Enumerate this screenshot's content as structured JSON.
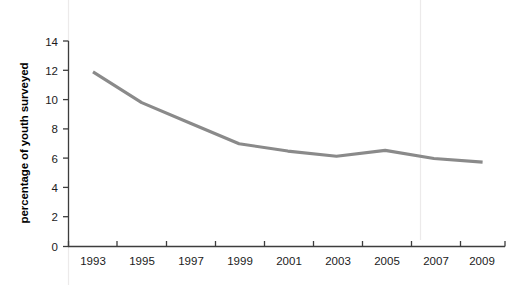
{
  "chart_data": {
    "type": "line",
    "title": "",
    "subtitle": "",
    "xlabel": "",
    "ylabel": "percentage of youth surveyed",
    "categories": [
      "1993",
      "1995",
      "1997",
      "1999",
      "2001",
      "2003",
      "2005",
      "2007",
      "2009"
    ],
    "x": [
      1993,
      1995,
      1997,
      1999,
      2001,
      2003,
      2005,
      2007,
      2009
    ],
    "values": [
      11.9,
      9.8,
      8.4,
      7.0,
      6.5,
      6.15,
      6.55,
      6.0,
      5.75
    ],
    "series": [
      {
        "name": "percentage of youth surveyed",
        "color": "#8a8a8a",
        "values": [
          11.9,
          9.8,
          8.4,
          7.0,
          6.5,
          6.15,
          6.55,
          6.0,
          5.75
        ]
      }
    ],
    "ylim": [
      0,
      14
    ],
    "ytick_values": [
      0,
      2,
      4,
      6,
      8,
      10,
      12,
      14
    ],
    "ytick_labels": [
      "0",
      "2",
      "4",
      "6",
      "8",
      "10",
      "12",
      "14"
    ],
    "xtick_labels": [
      "1993",
      "1995",
      "1997",
      "1999",
      "2001",
      "2003",
      "2005",
      "2007",
      "2009"
    ],
    "xlim": [
      1992,
      2010
    ],
    "grid": false,
    "legend": "none",
    "line_color": "#8a8a8a",
    "axis_color": "#3d3d3d",
    "text_color": "#1b1b1b",
    "background_color": "#ffffff"
  },
  "axes": {
    "y_title": "percentage of youth surveyed",
    "y_ticks": [
      "14",
      "12",
      "10",
      "8",
      "6",
      "4",
      "2",
      "0"
    ],
    "x_ticks": [
      "1993",
      "1995",
      "1997",
      "1999",
      "2001",
      "2003",
      "2005",
      "2007",
      "2009"
    ]
  }
}
